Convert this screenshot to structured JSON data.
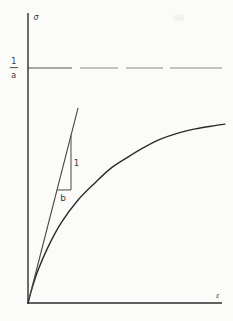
{
  "figure": {
    "kind": "scanned-textbook-graph",
    "background": "#fbfbf9",
    "labels": {
      "y_axis": "σ",
      "x_axis": "ε",
      "asymptote_numerator": "1",
      "asymptote_denominator": "a",
      "slope_rise": "1",
      "slope_run": "b"
    },
    "colors": {
      "axis": "#2e2e2e",
      "curve": "#2b2b2b",
      "tangent": "#474747",
      "dash": "#8a8a8a",
      "dash_first": "#555555",
      "text": "#3a3a3a",
      "artifact": "#ededea"
    }
  },
  "chart_data": {
    "type": "line",
    "title": "",
    "xlabel": "ε",
    "ylabel": "σ",
    "xlim": [
      0,
      1.0
    ],
    "ylim": [
      0,
      1.234
    ],
    "grid": false,
    "legend": "none",
    "axes_unlabeled": true,
    "series": [
      {
        "name": "saturation curve",
        "style": "smooth",
        "points": [
          [
            0,
            0
          ],
          [
            0.02,
            0.06
          ],
          [
            0.052,
            0.14
          ],
          [
            0.103,
            0.238
          ],
          [
            0.17,
            0.34
          ],
          [
            0.258,
            0.438
          ],
          [
            0.345,
            0.511
          ],
          [
            0.428,
            0.574
          ],
          [
            0.515,
            0.621
          ],
          [
            0.603,
            0.664
          ],
          [
            0.686,
            0.698
          ],
          [
            0.773,
            0.723
          ],
          [
            0.861,
            0.741
          ],
          [
            0.964,
            0.755
          ],
          [
            1.015,
            0.761
          ]
        ]
      },
      {
        "name": "initial tangent (slope 1/b)",
        "style": "line",
        "points": [
          [
            0,
            0
          ],
          [
            0.258,
            0.83
          ]
        ]
      },
      {
        "name": "asymptote σ = 1/a (dashed)",
        "style": "segments",
        "y": 1,
        "segments": [
          [
            0,
            0.227
          ],
          [
            0.268,
            0.464
          ],
          [
            0.505,
            0.696
          ],
          [
            0.732,
            1.0
          ]
        ]
      }
    ],
    "annotations": [
      {
        "name": "slope-triangle-vertical",
        "type": "line",
        "points": [
          [
            0.2216,
            0.713
          ],
          [
            0.2216,
            0.481
          ]
        ]
      },
      {
        "name": "slope-triangle-horizontal",
        "type": "line",
        "points": [
          [
            0.1495,
            0.481
          ],
          [
            0.2216,
            0.481
          ]
        ]
      }
    ]
  },
  "render": {
    "x0": 28,
    "y0": 303,
    "px_per_x": 194,
    "px_per_y": 235,
    "y_axis_top_px": 13,
    "axis_width": 1.4,
    "curve_width": 1.4,
    "line_width": 1.1,
    "dash_width": 1.2,
    "artifact": {
      "cx": 179,
      "cy": 17.5,
      "rx": 6,
      "ry": 3.5,
      "opacity": 0.65
    }
  }
}
